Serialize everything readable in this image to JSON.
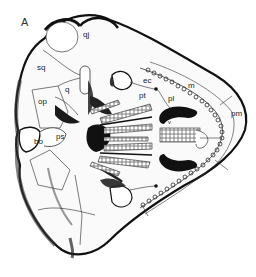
{
  "figure": {
    "panel_label": "A",
    "labels": [
      {
        "id": "qj",
        "text": "qj",
        "x": 83,
        "y": 31
      },
      {
        "id": "sq",
        "text": "sq",
        "x": 37,
        "y": 65
      },
      {
        "id": "q",
        "text": "q",
        "x": 65,
        "y": 86
      },
      {
        "id": "op",
        "text": "op",
        "x": 38,
        "y": 99
      },
      {
        "id": "ps",
        "text": "ps",
        "x": 56,
        "y": 133
      },
      {
        "id": "bo",
        "text": "bo",
        "x": 34,
        "y": 137
      },
      {
        "id": "ec",
        "text": "ec",
        "x": 143,
        "y": 78
      },
      {
        "id": "pt",
        "text": "pt",
        "x": 140,
        "y": 93
      },
      {
        "id": "pl",
        "text": "pl",
        "x": 169,
        "y": 96
      },
      {
        "id": "m",
        "text": "m",
        "x": 188,
        "y": 83
      },
      {
        "id": "pm",
        "text": "pm",
        "x": 232,
        "y": 111
      },
      {
        "id": "v",
        "text": "v",
        "x": 164,
        "y": 125
      }
    ]
  },
  "colors": {
    "ink": "#111111",
    "shade": "#2a2a2a",
    "paper": "#ffffff",
    "label": "#222222"
  }
}
